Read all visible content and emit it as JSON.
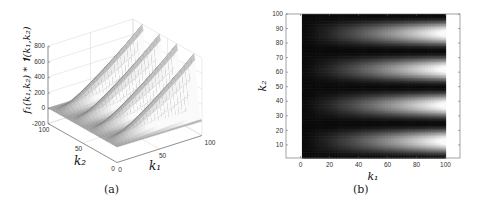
{
  "chart_data": [
    {
      "panel": "a",
      "type": "surface3d",
      "caption": "(a)",
      "zlabel": "f1(k1,k2) * 1(k1,k2)",
      "xlabel": "k1",
      "ylabel": "k2",
      "x_ticks": [
        "0",
        "50",
        "100"
      ],
      "y_ticks": [
        "0",
        "50",
        "100"
      ],
      "z_ticks": [
        "-200",
        "0",
        "200",
        "400",
        "600",
        "800"
      ],
      "xlim": [
        0,
        100
      ],
      "ylim": [
        0,
        100
      ],
      "zlim": [
        -200,
        800
      ],
      "grid": true,
      "colormap": "gray",
      "description": "Four ridges along k1 growing linearly with k1, peaks ~800 at k1=100, periodic in k2 with period ~25"
    },
    {
      "panel": "b",
      "type": "heatmap",
      "caption": "(b)",
      "xlabel": "k1",
      "ylabel": "k2",
      "x_ticks": [
        "0",
        "20",
        "40",
        "60",
        "80",
        "100"
      ],
      "y_ticks": [
        "10",
        "20",
        "30",
        "40",
        "50",
        "60",
        "70",
        "80",
        "90",
        "100"
      ],
      "xlim": [
        -10,
        110
      ],
      "ylim": [
        1,
        100
      ],
      "data_xrange": [
        1,
        100
      ],
      "data_yrange": [
        1,
        100
      ],
      "colormap": "gray",
      "bright_band_centers_k2": [
        12,
        37,
        62,
        87
      ],
      "dark_band_centers_k2": [
        0,
        24,
        49,
        74,
        99
      ],
      "intensity_grows_with_k1": true
    }
  ],
  "captions": {
    "a": "(a)",
    "b": "(b)"
  },
  "labels": {
    "a_z": "f₁(k₁,k₂) * 𝟏(k₁,k₂)",
    "a_x": "k₁",
    "a_y": "k₂",
    "b_x": "k₁",
    "b_y": "k₂"
  }
}
